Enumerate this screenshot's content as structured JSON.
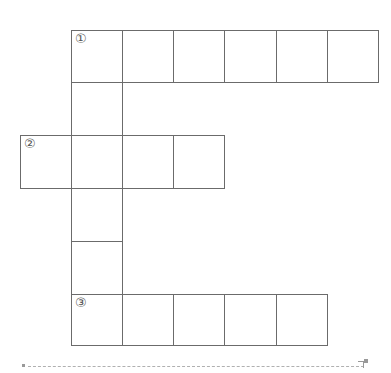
{
  "puzzle": {
    "type": "crossword-grid",
    "clues": [
      {
        "number": "①",
        "direction": "across",
        "row": 0,
        "col": 1,
        "length": 6
      },
      {
        "number": "②",
        "direction": "across",
        "row": 2,
        "col": 0,
        "length": 4
      },
      {
        "number": "③",
        "direction": "across",
        "row": 5,
        "col": 1,
        "length": 5
      }
    ],
    "vertical_column": {
      "col": 1,
      "row_start": 0,
      "row_end": 5
    }
  },
  "labels": {
    "one": "①",
    "two": "②",
    "three": "③"
  }
}
